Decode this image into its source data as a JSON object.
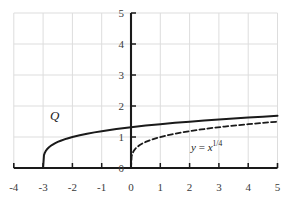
{
  "chart_data": {
    "type": "line",
    "title": "",
    "subtitle": "",
    "xlabel": "",
    "ylabel": "",
    "xlim": [
      -4,
      5
    ],
    "ylim": [
      0,
      5
    ],
    "xticks": [
      -4,
      -3,
      -2,
      -1,
      0,
      1,
      2,
      3,
      4,
      5
    ],
    "xtick_labels": [
      "-4",
      "-3",
      "-2",
      "-1",
      "0",
      "1",
      "2",
      "3",
      "4",
      "5"
    ],
    "yticks": [
      0,
      1,
      2,
      3,
      4,
      5
    ],
    "ytick_labels": [
      "0",
      "1",
      "2",
      "3",
      "4",
      "5"
    ],
    "grid": true,
    "grid_color": "#dddddd",
    "axis_color": "#1a1a1a",
    "background": "#ffffff",
    "legend": "none",
    "annotations": [
      {
        "name": "curve-label-Q",
        "text": "Q",
        "x": -2.6,
        "y": 1.55,
        "style": "italic-serif"
      },
      {
        "name": "equation-label",
        "text": "y = x^(1/4)",
        "text_base": "y = x",
        "text_exponent": "1/4",
        "x": 2.05,
        "y": 0.55,
        "style": "serif"
      }
    ],
    "series": [
      {
        "name": "Q",
        "label": "Q",
        "equation": "y = (x + 3)^(1/4)",
        "style": "solid",
        "color": "#1a1a1a",
        "width": 2.0,
        "domain": [
          -3,
          5
        ],
        "x": [
          -3.0,
          -2.97,
          -2.94,
          -2.9,
          -2.85,
          -2.8,
          -2.7,
          -2.6,
          -2.5,
          -2.4,
          -2.2,
          -2.0,
          -1.75,
          -1.5,
          -1.25,
          -1.0,
          -0.5,
          0.0,
          0.5,
          1.0,
          1.5,
          2.0,
          2.5,
          3.0,
          3.5,
          4.0,
          4.5,
          5.0
        ],
        "y": [
          0.0,
          0.416,
          0.495,
          0.562,
          0.622,
          0.669,
          0.74,
          0.795,
          0.841,
          0.88,
          0.946,
          1.0,
          1.057,
          1.106,
          1.149,
          1.189,
          1.257,
          1.316,
          1.368,
          1.414,
          1.457,
          1.495,
          1.532,
          1.565,
          1.597,
          1.627,
          1.655,
          1.682
        ]
      },
      {
        "name": "x-fourth-root",
        "label": "y = x^(1/4)",
        "equation": "y = x^(1/4)",
        "style": "dashed",
        "color": "#1a1a1a",
        "width": 1.8,
        "dash_pattern": "5,3",
        "domain": [
          0,
          5
        ],
        "x": [
          0.0,
          0.02,
          0.05,
          0.1,
          0.15,
          0.2,
          0.3,
          0.4,
          0.5,
          0.7,
          0.9,
          1.1,
          1.4,
          1.7,
          2.0,
          2.4,
          2.8,
          3.2,
          3.6,
          4.0,
          4.4,
          4.8,
          5.0
        ],
        "y": [
          0.0,
          0.376,
          0.473,
          0.562,
          0.622,
          0.669,
          0.74,
          0.795,
          0.841,
          0.915,
          0.974,
          1.024,
          1.088,
          1.142,
          1.189,
          1.244,
          1.294,
          1.337,
          1.377,
          1.414,
          1.448,
          1.48,
          1.495
        ]
      }
    ]
  }
}
